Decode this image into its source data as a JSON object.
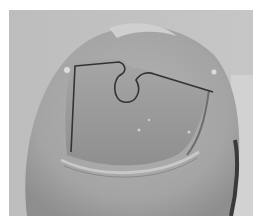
{
  "image": {
    "description": "Grayscale close-up photograph of a toenail fitted with a wire nail-correction brace",
    "subject": "toenail with wire brace",
    "colors": {
      "background": "#ffffff",
      "skin_light": "#c4c4c4",
      "skin_mid": "#a8a8a8",
      "nail": "#9a9a9a",
      "wire": "#3a3a3a",
      "shadow": "#2e2e2e"
    }
  }
}
